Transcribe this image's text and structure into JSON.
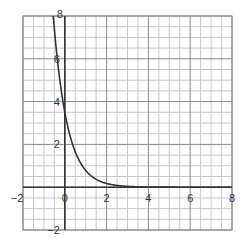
{
  "chart_data": {
    "type": "line",
    "title": "",
    "xlabel": "",
    "ylabel": "",
    "xlim": [
      -2,
      8
    ],
    "ylim": [
      -2,
      8
    ],
    "grid": true,
    "grid_minor_step": 0.5,
    "grid_major_step": 2,
    "x_ticks": [
      -2,
      0,
      2,
      4,
      6,
      8
    ],
    "x_tick_labels": [
      "−2",
      "0",
      "2",
      "4",
      "6",
      "8"
    ],
    "y_ticks": [
      -2,
      2,
      4,
      6,
      8
    ],
    "y_tick_labels": [
      "−2",
      "2",
      "4",
      "6",
      "8"
    ],
    "series": [
      {
        "name": "exponential decay",
        "function": "y = 3.5 * e^(-1.5x)",
        "x": [
          -0.56,
          -0.4,
          -0.2,
          0,
          0.25,
          0.5,
          0.75,
          1,
          1.5,
          2,
          2.5,
          3,
          4,
          5,
          6,
          7,
          8
        ],
        "y": [
          8.0,
          6.4,
          4.7,
          3.5,
          2.4,
          1.65,
          1.14,
          0.78,
          0.37,
          0.17,
          0.08,
          0.04,
          0.01,
          0.0,
          0.0,
          0.0,
          0.0
        ]
      }
    ],
    "colors": {
      "curve": "#333333",
      "axis": "#333333",
      "grid_minor": "#c8c8c8",
      "grid_major": "#8a8a8a"
    }
  }
}
